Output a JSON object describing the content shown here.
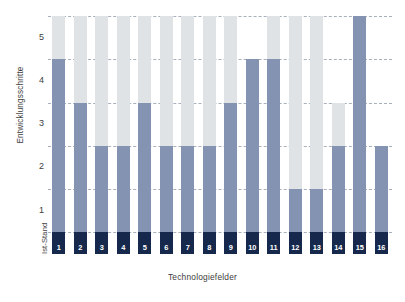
{
  "chart_data": {
    "type": "bar",
    "title": "",
    "subtitle": "",
    "xlabel": "Technologiefelder",
    "ylabel": "Entwicklungsschritte",
    "baseline_label_line1": "Ist-Stand",
    "baseline_label_line2": "2011",
    "categories": [
      "1",
      "2",
      "3",
      "4",
      "5",
      "6",
      "7",
      "8",
      "9",
      "10",
      "11",
      "12",
      "13",
      "14",
      "15",
      "16"
    ],
    "ylim": [
      0,
      5.5
    ],
    "yticks": [
      1,
      2,
      3,
      4,
      5
    ],
    "ytick_labels": [
      "1",
      "2",
      "3",
      "4",
      "5"
    ],
    "gridlines": [
      0.5,
      1.5,
      2.5,
      3.5,
      4.5,
      5.5
    ],
    "grid": true,
    "legend_position": "none",
    "stacked": true,
    "baseline_top": 0.5,
    "series": [
      {
        "name": "Ist-Stand 2011",
        "color": "#16294c",
        "values": [
          0.5,
          0.5,
          0.5,
          0.5,
          0.5,
          0.5,
          0.5,
          0.5,
          0.5,
          0.5,
          0.5,
          0.5,
          0.5,
          0.5,
          0.5,
          0.5
        ]
      },
      {
        "name": "Entwicklungsschritte erreicht",
        "color": "#8393b1",
        "tops": [
          4.5,
          3.5,
          2.5,
          2.5,
          3.5,
          2.5,
          2.5,
          2.5,
          3.5,
          4.5,
          4.5,
          1.5,
          1.5,
          2.5,
          5.5,
          2.5
        ],
        "values": [
          4.0,
          3.0,
          2.0,
          2.0,
          3.0,
          2.0,
          2.0,
          2.0,
          3.0,
          4.0,
          4.0,
          1.0,
          1.0,
          2.0,
          5.0,
          2.0
        ]
      },
      {
        "name": "Entwicklungspotenzial",
        "color": "#e0e3e6",
        "tops": [
          5.5,
          5.5,
          5.5,
          5.5,
          5.5,
          5.5,
          5.5,
          5.5,
          5.5,
          4.5,
          5.5,
          5.5,
          5.5,
          3.5,
          5.5,
          2.5
        ],
        "values": [
          1.0,
          2.0,
          3.0,
          3.0,
          2.0,
          3.0,
          3.0,
          3.0,
          2.0,
          0.0,
          1.0,
          4.0,
          4.0,
          1.0,
          0.0,
          0.0
        ]
      }
    ],
    "colors": {
      "base": "#16294c",
      "progress": "#8393b1",
      "potential": "#e0e3e6",
      "grid": "#9aa3b0",
      "text": "#3d3d3d",
      "background": "#ffffff"
    }
  }
}
